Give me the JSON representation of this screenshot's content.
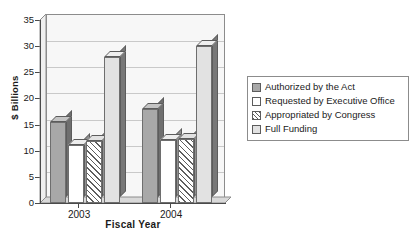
{
  "chart_data": {
    "type": "bar",
    "title": "",
    "subtitle": "",
    "xlabel": "Fiscal Year",
    "ylabel": "$ Billions",
    "categories": [
      "2003",
      "2004"
    ],
    "series": [
      {
        "name": "Authorized by the Act",
        "values": [
          15.5,
          18.0
        ],
        "swatch": "solid-medium-gray"
      },
      {
        "name": "Requested by Executive Office",
        "values": [
          11.0,
          12.0
        ],
        "swatch": "white"
      },
      {
        "name": "Appropriated by Congress",
        "values": [
          11.8,
          12.2
        ],
        "swatch": "diagonal-hatch"
      },
      {
        "name": "Full Funding",
        "values": [
          28.0,
          30.0
        ],
        "swatch": "light-gray"
      }
    ],
    "ylim": [
      0,
      35
    ],
    "yticks": [
      "0",
      "5",
      "10",
      "15",
      "20",
      "25",
      "30",
      "35"
    ],
    "ytick_values": [
      0,
      5,
      10,
      15,
      20,
      25,
      30,
      35
    ],
    "grid": true,
    "grid_axis": "y",
    "legend_position": "right",
    "style": "3d-column",
    "colors": {
      "authorized": "#a8a8a8",
      "requested": "#ffffff",
      "appropriated": "#ffffff",
      "full_funding": "#e2e2e2",
      "gridline": "#c9c9c9",
      "axis": "#4a4a4a",
      "plot_background": "#f7f7f7",
      "bar_outline": "#6e6e6e"
    }
  },
  "legend": {
    "items": [
      {
        "label": "Authorized by the Act"
      },
      {
        "label": "Requested by Executive Office"
      },
      {
        "label": "Appropriated by Congress"
      },
      {
        "label": "Full Funding"
      }
    ]
  }
}
